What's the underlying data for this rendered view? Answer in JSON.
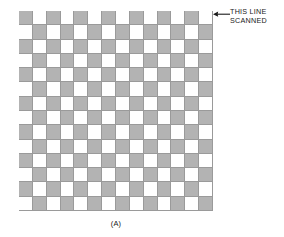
{
  "figure": {
    "caption": "(A)",
    "background_color": "#ffffff"
  },
  "annotation": {
    "text": "THIS LINE\nSCANNED",
    "line1": "THIS LINE",
    "line2": "SCANNED",
    "arrow_direction": "left",
    "points_to": "top-right corner of checkerboard",
    "text_color": "#1a1a1a"
  },
  "chart_data": {
    "type": "heatmap",
    "title": "",
    "subtitle": "",
    "xlabel": "",
    "ylabel": "",
    "legend": [],
    "annotations": [
      {
        "text": "THIS LINE SCANNED",
        "target_row": 0,
        "arrow": "left"
      }
    ],
    "grid": true,
    "rows": 14,
    "cols": 14,
    "cell_width_px": 13.857,
    "cell_height_px": 14.285,
    "colors": {
      "dark": "#b3b3b3",
      "light": "#ffffff",
      "gridline": "#9a9a9a"
    },
    "pattern": "checkerboard",
    "values": [
      [
        1,
        0,
        1,
        0,
        1,
        0,
        1,
        0,
        1,
        0,
        1,
        0,
        1,
        0
      ],
      [
        0,
        1,
        0,
        1,
        0,
        1,
        0,
        1,
        0,
        1,
        0,
        1,
        0,
        1
      ],
      [
        1,
        0,
        1,
        0,
        1,
        0,
        1,
        0,
        1,
        0,
        1,
        0,
        1,
        0
      ],
      [
        0,
        1,
        0,
        1,
        0,
        1,
        0,
        1,
        0,
        1,
        0,
        1,
        0,
        1
      ],
      [
        1,
        0,
        1,
        0,
        1,
        0,
        1,
        0,
        1,
        0,
        1,
        0,
        1,
        0
      ],
      [
        0,
        1,
        0,
        1,
        0,
        1,
        0,
        1,
        0,
        1,
        0,
        1,
        0,
        1
      ],
      [
        1,
        0,
        1,
        0,
        1,
        0,
        1,
        0,
        1,
        0,
        1,
        0,
        1,
        0
      ],
      [
        0,
        1,
        0,
        1,
        0,
        1,
        0,
        1,
        0,
        1,
        0,
        1,
        0,
        1
      ],
      [
        1,
        0,
        1,
        0,
        1,
        0,
        1,
        0,
        1,
        0,
        1,
        0,
        1,
        0
      ],
      [
        0,
        1,
        0,
        1,
        0,
        1,
        0,
        1,
        0,
        1,
        0,
        1,
        0,
        1
      ],
      [
        1,
        0,
        1,
        0,
        1,
        0,
        1,
        0,
        1,
        0,
        1,
        0,
        1,
        0
      ],
      [
        0,
        1,
        0,
        1,
        0,
        1,
        0,
        1,
        0,
        1,
        0,
        1,
        0,
        1
      ],
      [
        1,
        0,
        1,
        0,
        1,
        0,
        1,
        0,
        1,
        0,
        1,
        0,
        1,
        0
      ],
      [
        0,
        1,
        0,
        1,
        0,
        1,
        0,
        1,
        0,
        1,
        0,
        1,
        0,
        1
      ]
    ]
  }
}
